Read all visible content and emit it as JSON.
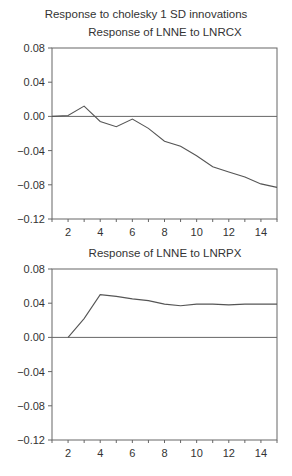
{
  "main_title": "Response to cholesky 1 SD innovations",
  "chart_data": [
    {
      "type": "line",
      "title": "Response of LNNE to LNRCX",
      "xlabel": "",
      "ylabel": "",
      "x": [
        1,
        2,
        3,
        4,
        5,
        6,
        7,
        8,
        9,
        10,
        11,
        12,
        13,
        14,
        15
      ],
      "series": [
        {
          "name": "LNNE to LNRCX",
          "values": [
            0.0,
            0.001,
            0.012,
            -0.006,
            -0.012,
            -0.003,
            -0.014,
            -0.029,
            -0.035,
            -0.046,
            -0.059,
            -0.065,
            -0.071,
            -0.079,
            -0.083
          ]
        }
      ],
      "xlim": [
        1,
        15
      ],
      "ylim": [
        -0.12,
        0.08
      ],
      "x_ticks": [
        "2",
        "4",
        "6",
        "8",
        "10",
        "12",
        "14"
      ],
      "y_ticks": [
        "0.08",
        "0.04",
        "0.00",
        "−0.04",
        "−0.08",
        "−0.12"
      ],
      "zero_line": true,
      "grid": false,
      "legend": "none"
    },
    {
      "type": "line",
      "title": "Response of LNNE to LNRPX",
      "xlabel": "",
      "ylabel": "",
      "x": [
        2,
        3,
        4,
        5,
        6,
        7,
        8,
        9,
        10,
        11,
        12,
        13,
        14,
        15
      ],
      "series": [
        {
          "name": "LNNE to LNRPX",
          "values": [
            0.0,
            0.022,
            0.05,
            0.048,
            0.045,
            0.043,
            0.039,
            0.037,
            0.039,
            0.039,
            0.038,
            0.039,
            0.039,
            0.039
          ]
        }
      ],
      "xlim": [
        1,
        15
      ],
      "ylim": [
        -0.12,
        0.08
      ],
      "x_ticks": [
        "2",
        "4",
        "6",
        "8",
        "10",
        "12",
        "14"
      ],
      "y_ticks": [
        "0.08",
        "0.04",
        "0.00",
        "−0.04",
        "−0.08",
        "−0.12"
      ],
      "zero_line": true,
      "grid": false,
      "legend": "none"
    }
  ]
}
